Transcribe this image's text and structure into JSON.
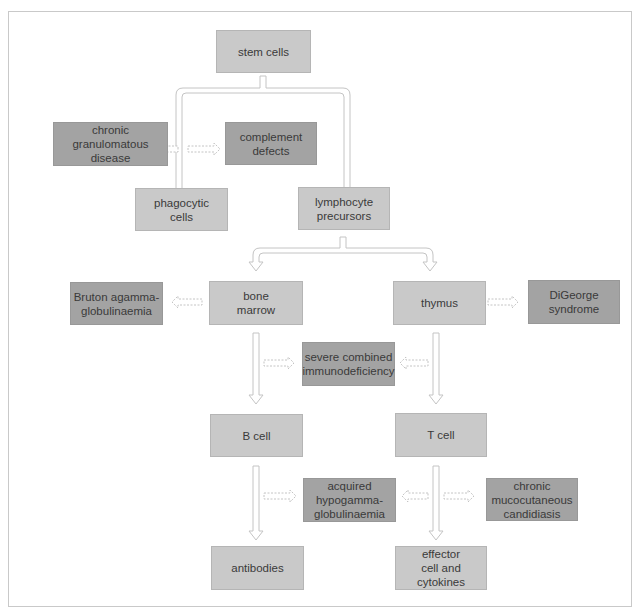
{
  "diagram": {
    "type": "flowchart",
    "colors": {
      "process_box": "#c9c9c9",
      "disorder_box": "#a3a3a3",
      "arrow_outline": "#c8c8c8",
      "frame": "#c9c9c9"
    },
    "nodes": {
      "stem_cells": "stem cells",
      "chronic_granulomatous": "chronic\ngranulomatous\ndisease",
      "complement_defects": "complement\ndefects",
      "phagocytic_cells": "phagocytic\ncells",
      "lymphocyte_precursors": "lymphocyte\nprecursors",
      "bruton": "Bruton agamma-\nglobulinaemia",
      "bone_marrow": "bone\nmarrow",
      "thymus": "thymus",
      "digeorge": "DiGeorge\nsyndrome",
      "scid": "severe combined\nimmunodeficiency",
      "b_cell": "B cell",
      "t_cell": "T cell",
      "acquired_hypo": "acquired\nhypogamma-\nglobulinaemia",
      "chronic_mucocutaneous": "chronic\nmucocutaneous\ncandidiasis",
      "antibodies": "antibodies",
      "effector": "effector\ncell and\ncytokines"
    },
    "edges": [
      {
        "from": "stem cells",
        "to": "phagocytic cells",
        "style": "solid"
      },
      {
        "from": "stem cells",
        "to": "lymphocyte precursors",
        "style": "solid"
      },
      {
        "from": "lymphocyte precursors",
        "to": "bone marrow",
        "style": "solid"
      },
      {
        "from": "lymphocyte precursors",
        "to": "thymus",
        "style": "solid"
      },
      {
        "from": "bone marrow",
        "to": "B cell",
        "style": "solid"
      },
      {
        "from": "thymus",
        "to": "T cell",
        "style": "solid"
      },
      {
        "from": "B cell",
        "to": "antibodies",
        "style": "solid"
      },
      {
        "from": "T cell",
        "to": "effector cell and cytokines",
        "style": "solid"
      },
      {
        "from": "chronic granulomatous disease",
        "to": "phagocytic cells",
        "style": "dashed"
      },
      {
        "from": "complement defects",
        "to": "phagocytic cells",
        "style": "dashed"
      },
      {
        "from": "Bruton agammaglobulinaemia",
        "to": "bone marrow",
        "style": "dashed"
      },
      {
        "from": "DiGeorge syndrome",
        "to": "thymus",
        "style": "dashed"
      },
      {
        "from": "severe combined immunodeficiency",
        "to": "bone marrow → B cell",
        "style": "dashed"
      },
      {
        "from": "severe combined immunodeficiency",
        "to": "thymus → T cell",
        "style": "dashed"
      },
      {
        "from": "acquired hypogammaglobulinaemia",
        "to": "B cell → antibodies",
        "style": "dashed"
      },
      {
        "from": "acquired hypogammaglobulinaemia",
        "to": "T cell → effector",
        "style": "dashed"
      },
      {
        "from": "chronic mucocutaneous candidiasis",
        "to": "T cell → effector",
        "style": "dashed"
      }
    ]
  }
}
